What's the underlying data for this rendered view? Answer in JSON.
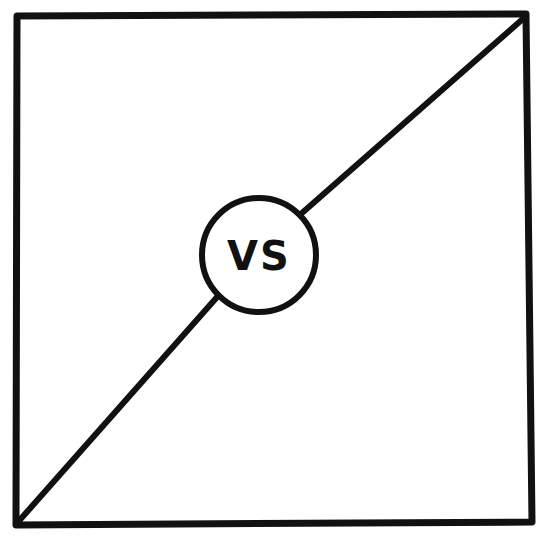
{
  "diagram": {
    "label": "VS",
    "stroke_color": "#111111",
    "background_color": "#ffffff",
    "frame": {
      "shape": "square"
    },
    "divider": {
      "direction": "bottom-left to top-right diagonal"
    },
    "badge": {
      "shape": "circle",
      "position": "center"
    }
  }
}
